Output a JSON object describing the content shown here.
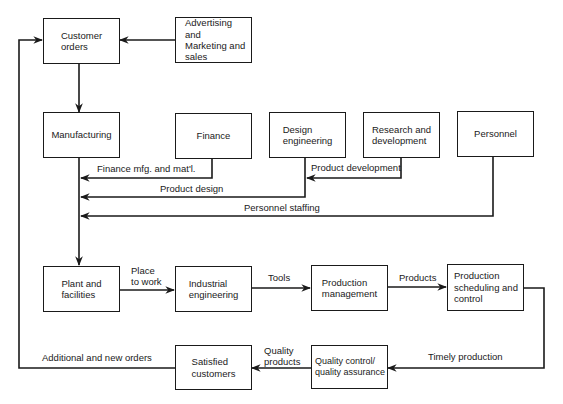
{
  "colors": {
    "ink": "#1a1a1a",
    "background": "#ffffff"
  },
  "boxes": {
    "customer_orders": "Customer\norders",
    "advertising": "Advertising\nand\nMarketing and\nsales",
    "manufacturing": "Manufacturing",
    "finance": "Finance",
    "design_engineering": "Design\nengineering",
    "research": "Research and\ndevelopment",
    "personnel": "Personnel",
    "plant": "Plant and\nfacilities",
    "industrial_engineering": "Industrial\nengineering",
    "production_management": "Production\nmanagement",
    "production_scheduling": "Production\nscheduling and\ncontrol",
    "quality_control": "Quality control/\nquality assurance",
    "satisfied_customers": "Satisfied\ncustomers"
  },
  "edges": {
    "finance_mfg": "Finance mfg. and mat'l.",
    "product_development": "Product development",
    "product_design": "Product design",
    "personnel_staffing": "Personnel staffing",
    "place_to_work": "Place\nto work",
    "tools": "Tools",
    "products": "Products",
    "timely_production": "Timely production",
    "quality_products": "Quality\nproducts",
    "additional_orders": "Additional and new orders"
  }
}
